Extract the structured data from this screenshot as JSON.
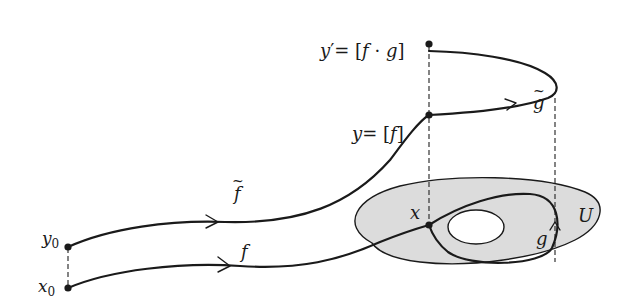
{
  "diagram": {
    "type": "covering-space path lifting",
    "colors": {
      "ink": "#1a1a1a",
      "region_fill": "#dcdcdc",
      "hole_fill": "#ffffff",
      "background": "#ffffff"
    },
    "labels": {
      "y0": "y",
      "y0_sub": "0",
      "x0": "x",
      "x0_sub": "0",
      "f_tilde": "f",
      "f": "f",
      "y_lhs": "y",
      "y_eq": "= [",
      "y_f": "f",
      "y_close": "]",
      "yprime_lhs": "y",
      "yprime_prime": "′",
      "yprime_eq": "= [",
      "yprime_f": "f",
      "yprime_dot": " · ",
      "yprime_g": "g",
      "yprime_close": "]",
      "g_tilde": "g",
      "tilde": "~",
      "x": "x",
      "g": "g",
      "U": "U"
    },
    "points": [
      {
        "name": "x0",
        "label": "x₀"
      },
      {
        "name": "y0",
        "label": "y₀"
      },
      {
        "name": "x",
        "label": "x"
      },
      {
        "name": "y",
        "label": "y = [f]"
      },
      {
        "name": "y_prime",
        "label": "y′ = [f · g]"
      }
    ],
    "paths": [
      {
        "name": "f",
        "from": "x0",
        "to": "x",
        "label": "f"
      },
      {
        "name": "f_tilde",
        "from": "y0",
        "to": "y",
        "label": "f̃"
      },
      {
        "name": "g",
        "from": "x",
        "to": "x",
        "label": "g",
        "loop": true
      },
      {
        "name": "g_tilde",
        "from": "y",
        "to": "y_prime",
        "label": "g̃"
      }
    ],
    "region": {
      "name": "U",
      "label": "U",
      "has_hole": true
    }
  }
}
